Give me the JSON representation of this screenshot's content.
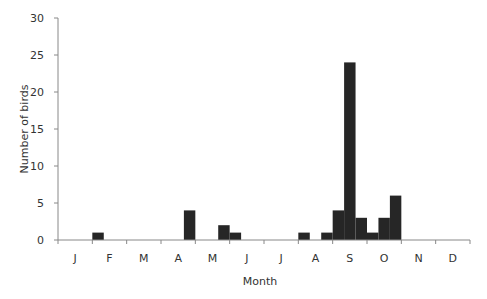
{
  "chart_data": {
    "type": "bar",
    "title": "",
    "xlabel": "Month",
    "ylabel": "Number of birds",
    "ylim": [
      0,
      30
    ],
    "yticks": [
      0,
      5,
      10,
      15,
      20,
      25,
      30
    ],
    "month_labels": [
      "J",
      "F",
      "M",
      "A",
      "M",
      "J",
      "J",
      "A",
      "S",
      "O",
      "N",
      "D"
    ],
    "bins_per_month": 3,
    "grid": false,
    "legend": null,
    "bar_color": "#262626",
    "categories": [
      "Jan-1",
      "Jan-2",
      "Jan-3",
      "Feb-1",
      "Feb-2",
      "Feb-3",
      "Mar-1",
      "Mar-2",
      "Mar-3",
      "Apr-1",
      "Apr-2",
      "Apr-3",
      "May-1",
      "May-2",
      "May-3",
      "Jun-1",
      "Jun-2",
      "Jun-3",
      "Jul-1",
      "Jul-2",
      "Jul-3",
      "Aug-1",
      "Aug-2",
      "Aug-3",
      "Sep-1",
      "Sep-2",
      "Sep-3",
      "Oct-1",
      "Oct-2",
      "Oct-3",
      "Nov-1",
      "Nov-2",
      "Nov-3",
      "Dec-1",
      "Dec-2",
      "Dec-3"
    ],
    "values": [
      0,
      0,
      0,
      1,
      0,
      0,
      0,
      0,
      0,
      0,
      0,
      4,
      0,
      0,
      2,
      1,
      0,
      0,
      0,
      0,
      0,
      1,
      0,
      1,
      4,
      24,
      3,
      1,
      3,
      6,
      0,
      0,
      0,
      0,
      0,
      0
    ]
  }
}
